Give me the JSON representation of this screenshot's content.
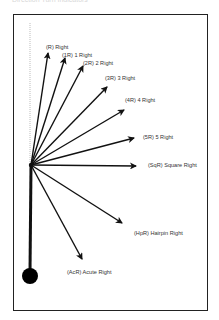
{
  "caption": "Direction Turn Indicators",
  "diagram": {
    "type": "direction-fan",
    "origin": [
      31,
      165
    ],
    "colors": {
      "line": "#111111",
      "label": "#333333",
      "frame": "#222222",
      "guide": "#bbbbbb"
    },
    "arrows": [
      {
        "code": "(R)",
        "label": "(R) Right",
        "tip": [
          48,
          53
        ],
        "label_pos": [
          46,
          45
        ]
      },
      {
        "code": "(1R)",
        "label": "(1R) 1 Right",
        "tip": [
          65,
          58
        ],
        "label_pos": [
          62,
          53
        ]
      },
      {
        "code": "(2R)",
        "label": "(2R) 2 Right",
        "tip": [
          83,
          66
        ],
        "label_pos": [
          83,
          61
        ]
      },
      {
        "code": "(3R)",
        "label": "(3R) 3 Right",
        "tip": [
          107,
          87
        ],
        "label_pos": [
          105,
          76
        ]
      },
      {
        "code": "(4R)",
        "label": "(4R) 4 Right",
        "tip": [
          124,
          110
        ],
        "label_pos": [
          125,
          98
        ]
      },
      {
        "code": "(5R)",
        "label": "(5R) 5 Right",
        "tip": [
          134,
          138
        ],
        "label_pos": [
          143,
          135
        ]
      },
      {
        "code": "(SqR)",
        "label": "(SqR) Square Right",
        "tip": [
          136,
          166
        ],
        "label_pos": [
          148,
          163
        ]
      },
      {
        "code": "(HpR)",
        "label": "(HpR) Hairpin Right",
        "tip": [
          122,
          223
        ],
        "label_pos": [
          134,
          231
        ]
      },
      {
        "code": "(AcR)",
        "label": "(AcR) Acute Right",
        "tip": [
          82,
          259
        ],
        "label_pos": [
          67,
          270
        ]
      }
    ],
    "labels": {
      "r": "(R) Right",
      "r1": "(1R) 1 Right",
      "r2": "(2R) 2 Right",
      "r3": "(3R) 3 Right",
      "r4": "(4R) 4 Right",
      "r5": "(5R) 5 Right",
      "sqr": "(SqR) Square Right",
      "hpr": "(HpR) Hairpin Right",
      "acr": "(AcR) Acute Right"
    }
  }
}
